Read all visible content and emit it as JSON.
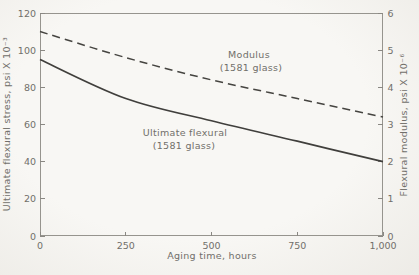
{
  "figure": {
    "background": "#f6f5f1",
    "frame_color": "#96948e",
    "tick_color": "#8a8883",
    "text_color": "#716f6a",
    "solid_curve_color": "#403f3c",
    "dashed_curve_color": "#454440"
  },
  "chart_data": {
    "type": "line",
    "title": "",
    "xlabel": "Aging time, hours",
    "x": [
      0,
      250,
      500,
      750,
      1000
    ],
    "x_tick_labels": [
      "0",
      "250",
      "500",
      "750",
      "1,000"
    ],
    "xlim": [
      0,
      1000
    ],
    "grid": false,
    "legend": "inline-curve-labels",
    "left_axis": {
      "label": "Ultimate flexural stress, psi X 10⁻³",
      "lim": [
        0,
        120
      ],
      "ticks": [
        0,
        20,
        40,
        60,
        80,
        100,
        120
      ]
    },
    "right_axis": {
      "label": "Flexural modulus, psi X 10⁻⁶",
      "lim": [
        0,
        6
      ],
      "ticks": [
        0,
        1,
        2,
        3,
        4,
        5,
        6
      ]
    },
    "series": [
      {
        "name": "Modulus (1581 glass)",
        "axis": "right",
        "line_style": "dashed",
        "values": [
          5.5,
          4.8,
          4.2,
          3.7,
          3.2
        ]
      },
      {
        "name": "Ultimate flexural (1581 glass)",
        "axis": "left",
        "line_style": "solid",
        "values": [
          95,
          74,
          62,
          51,
          40
        ]
      }
    ],
    "annotations": [
      {
        "series": "Modulus (1581 glass)",
        "lines": [
          "Modulus",
          "(1581 glass)"
        ]
      },
      {
        "series": "Ultimate flexural (1581 glass)",
        "lines": [
          "Ultimate flexural",
          "(1581 glass)"
        ]
      }
    ]
  }
}
